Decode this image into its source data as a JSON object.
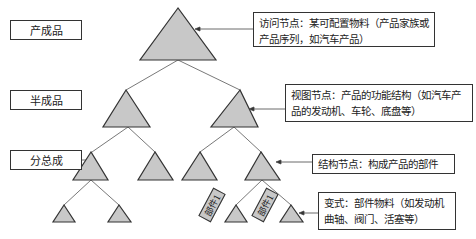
{
  "levels": [
    {
      "label": "产成品"
    },
    {
      "label": "半成品"
    },
    {
      "label": "分总成"
    }
  ],
  "callouts": [
    {
      "text": "访问节点：某可配置物料（产品家族或产品序列，如汽车产品）"
    },
    {
      "text": "视图节点：产品的功能结构（如汽车产品的发动机、车轮、底盘等）"
    },
    {
      "text": "结构节点：构成产品的部件"
    },
    {
      "text": "变式：部件物料（如发动机曲轴、阀门、活塞等）"
    }
  ],
  "parts": [
    {
      "label": "部件1"
    },
    {
      "label": "部件1"
    }
  ],
  "colors": {
    "triangle_fill": "#c8c8c8",
    "stroke": "#333333"
  }
}
